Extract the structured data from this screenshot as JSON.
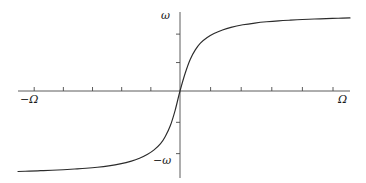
{
  "figure": {
    "title": "",
    "background_color": "#ffffff",
    "line_color": "#2b2b2b",
    "axis_color": "#4a4a4a",
    "width": 366,
    "height": 183
  },
  "labels": {
    "x_negative": "−Ω",
    "x_positive": "Ω",
    "y_positive": "ω",
    "y_negative": "−ω"
  },
  "chart_data": {
    "type": "line",
    "title": "",
    "xlabel": "",
    "ylabel": "",
    "xlim": [
      -1.0,
      1.0
    ],
    "ylim": [
      -1.0,
      1.0
    ],
    "grid": false,
    "legend": null,
    "axis_style": "centered-cross-with-ticks",
    "x_tick_labels": [
      "−Ω",
      "Ω"
    ],
    "y_tick_labels": [
      "ω",
      "−ω"
    ],
    "x_ticks": [
      -0.9,
      -0.72,
      -0.54,
      -0.36,
      -0.18,
      0.18,
      0.36,
      0.54,
      0.72,
      0.9
    ],
    "y_ticks": [
      -0.72,
      -0.36,
      0.36,
      0.72
    ],
    "series": [
      {
        "name": "saturation-curve",
        "x": [
          -1.0,
          -0.93,
          -0.86,
          -0.79,
          -0.72,
          -0.65,
          -0.58,
          -0.51,
          -0.44,
          -0.37,
          -0.3,
          -0.25,
          -0.2,
          -0.16,
          -0.12,
          -0.09,
          -0.06,
          -0.03,
          0.0,
          0.03,
          0.06,
          0.09,
          0.12,
          0.16,
          0.2,
          0.25,
          0.3,
          0.37,
          0.44,
          0.51,
          0.58,
          0.65,
          0.72,
          0.79,
          0.86,
          0.93,
          1.0
        ],
        "y": [
          -0.925,
          -0.921,
          -0.916,
          -0.911,
          -0.905,
          -0.897,
          -0.888,
          -0.876,
          -0.86,
          -0.838,
          -0.806,
          -0.773,
          -0.727,
          -0.677,
          -0.606,
          -0.52,
          -0.4,
          -0.222,
          0.0,
          0.222,
          0.4,
          0.52,
          0.606,
          0.677,
          0.727,
          0.773,
          0.806,
          0.838,
          0.86,
          0.876,
          0.888,
          0.897,
          0.905,
          0.911,
          0.916,
          0.921,
          0.925
        ]
      }
    ]
  }
}
